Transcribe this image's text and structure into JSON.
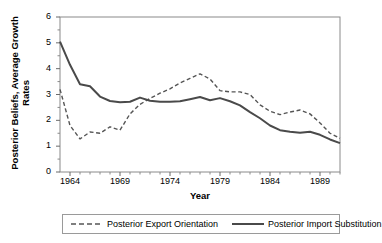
{
  "chart_data": {
    "type": "line",
    "title": "",
    "xlabel": "Year",
    "ylabel_line1": "Posterior Beliefs, Average Growth",
    "ylabel_line2": "Rates",
    "xlim": [
      1963,
      1991
    ],
    "ylim": [
      0,
      6
    ],
    "yticks": [
      0,
      1,
      2,
      3,
      4,
      5,
      6
    ],
    "ytick_labels": [
      "0",
      "1",
      "2",
      "3",
      "4",
      "5",
      "6"
    ],
    "xtick_labels": [
      "1964",
      "1969",
      "1974",
      "1979",
      "1984",
      "1989"
    ],
    "xtick_values": [
      1964,
      1969,
      1974,
      1979,
      1984,
      1989
    ],
    "minor_xticks_every": 1,
    "grid": false,
    "legend_position": "below-outside",
    "x": [
      1963,
      1964,
      1965,
      1966,
      1967,
      1968,
      1969,
      1970,
      1971,
      1972,
      1973,
      1974,
      1975,
      1976,
      1977,
      1978,
      1979,
      1980,
      1981,
      1982,
      1983,
      1984,
      1985,
      1986,
      1987,
      1988,
      1989,
      1990,
      1991
    ],
    "series": [
      {
        "name": "Posterior Export Orientation",
        "style": "dashed",
        "color": "#555555",
        "values": [
          3.2,
          1.8,
          1.28,
          1.55,
          1.5,
          1.75,
          1.62,
          2.25,
          2.62,
          2.85,
          3.05,
          3.22,
          3.45,
          3.62,
          3.8,
          3.6,
          3.15,
          3.1,
          3.1,
          3.0,
          2.6,
          2.35,
          2.22,
          2.32,
          2.4,
          2.25,
          1.9,
          1.5,
          1.3
        ]
      },
      {
        "name": "Posterior Import Substitution",
        "style": "solid",
        "color": "#4a4a4a",
        "values": [
          5.05,
          4.15,
          3.4,
          3.32,
          2.92,
          2.75,
          2.7,
          2.72,
          2.88,
          2.76,
          2.72,
          2.72,
          2.74,
          2.82,
          2.9,
          2.78,
          2.86,
          2.74,
          2.58,
          2.32,
          2.08,
          1.8,
          1.62,
          1.56,
          1.52,
          1.56,
          1.44,
          1.26,
          1.12
        ]
      }
    ]
  },
  "legend": {
    "items": [
      {
        "label": "Posterior Export Orientation"
      },
      {
        "label": "Posterior Import Substitution"
      }
    ]
  }
}
